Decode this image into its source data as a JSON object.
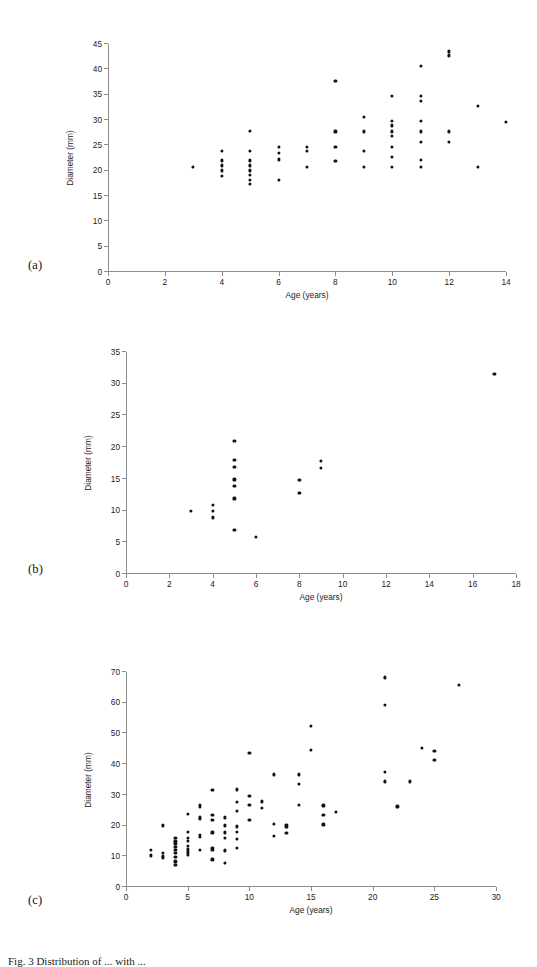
{
  "figure": {
    "caption": "Fig. 3  Distribution of ... with ...",
    "panels": [
      {
        "letter": "(a)"
      },
      {
        "letter": "(b)"
      },
      {
        "letter": "(c)"
      }
    ]
  },
  "chart_data": [
    {
      "type": "scatter",
      "panel": "(a)",
      "title": "",
      "xlabel": "Age (years)",
      "ylabel": "Diameter (mm)",
      "xlim": [
        0,
        14
      ],
      "ylim": [
        0,
        45
      ],
      "xticks": [
        0,
        2,
        4,
        6,
        8,
        10,
        12,
        14
      ],
      "yticks": [
        0,
        5,
        10,
        15,
        20,
        25,
        30,
        35,
        40,
        45
      ],
      "grid": false,
      "legend": null,
      "points": [
        [
          3,
          20.7
        ],
        [
          4,
          23.8
        ],
        [
          4,
          22.0
        ],
        [
          4,
          21.0
        ],
        [
          4,
          20.0
        ],
        [
          4,
          18.9
        ],
        [
          5,
          27.8
        ],
        [
          5,
          23.8
        ],
        [
          5,
          22.0
        ],
        [
          5,
          21.0
        ],
        [
          5,
          20.0
        ],
        [
          5,
          19.2
        ],
        [
          5,
          18.2
        ],
        [
          5,
          17.4
        ],
        [
          6,
          24.7
        ],
        [
          6,
          23.4
        ],
        [
          6,
          22.2
        ],
        [
          6,
          18.2
        ],
        [
          7,
          24.7
        ],
        [
          7,
          23.8
        ],
        [
          7,
          20.7
        ],
        [
          8,
          37.7
        ],
        [
          8,
          27.7
        ],
        [
          8,
          24.7
        ],
        [
          8,
          21.9
        ],
        [
          9,
          30.6
        ],
        [
          9,
          27.7
        ],
        [
          9,
          23.8
        ],
        [
          9,
          20.7
        ],
        [
          10,
          34.8
        ],
        [
          10,
          29.8
        ],
        [
          10,
          28.9
        ],
        [
          10,
          27.7
        ],
        [
          10,
          26.8
        ],
        [
          10,
          24.7
        ],
        [
          10,
          22.7
        ],
        [
          10,
          20.7
        ],
        [
          11,
          40.6
        ],
        [
          11,
          34.8
        ],
        [
          11,
          33.8
        ],
        [
          11,
          29.8
        ],
        [
          11,
          27.7
        ],
        [
          11,
          25.7
        ],
        [
          11,
          22.1
        ],
        [
          11,
          20.7
        ],
        [
          12,
          43.5
        ],
        [
          12,
          42.7
        ],
        [
          12,
          27.7
        ],
        [
          12,
          25.7
        ],
        [
          13,
          32.7
        ],
        [
          13,
          20.7
        ],
        [
          14,
          29.6
        ]
      ]
    },
    {
      "type": "scatter",
      "panel": "(b)",
      "title": "",
      "xlabel": "Age (years)",
      "ylabel": "Diameter (mm)",
      "xlim": [
        0,
        18
      ],
      "ylim": [
        0,
        35
      ],
      "xticks": [
        0,
        2,
        4,
        6,
        8,
        10,
        12,
        14,
        16,
        18
      ],
      "yticks": [
        0,
        5,
        10,
        15,
        20,
        25,
        30,
        35
      ],
      "grid": false,
      "legend": null,
      "points": [
        [
          3,
          9.9
        ],
        [
          4,
          10.9
        ],
        [
          4,
          9.9
        ],
        [
          4,
          8.9
        ],
        [
          5,
          20.9
        ],
        [
          5,
          17.9
        ],
        [
          5,
          16.9
        ],
        [
          5,
          14.9
        ],
        [
          5,
          13.9
        ],
        [
          5,
          11.9
        ],
        [
          5,
          6.9
        ],
        [
          6,
          5.8
        ],
        [
          8,
          14.8
        ],
        [
          8,
          12.8
        ],
        [
          9,
          17.8
        ],
        [
          9,
          16.7
        ],
        [
          17,
          31.5
        ]
      ]
    },
    {
      "type": "scatter",
      "panel": "(c)",
      "title": "",
      "xlabel": "Age (years)",
      "ylabel": "Diameter (mm)",
      "xlim": [
        0,
        30
      ],
      "ylim": [
        0,
        70
      ],
      "xticks": [
        0,
        5,
        10,
        15,
        20,
        25,
        30
      ],
      "yticks": [
        0,
        10,
        20,
        30,
        40,
        50,
        60,
        70
      ],
      "grid": false,
      "legend": null,
      "points": [
        [
          2,
          12.0
        ],
        [
          2,
          10.2
        ],
        [
          3,
          20.0
        ],
        [
          3,
          11.0
        ],
        [
          3,
          10.0
        ],
        [
          3,
          9.6
        ],
        [
          4,
          16.0
        ],
        [
          4,
          14.8
        ],
        [
          4,
          13.9
        ],
        [
          4,
          12.9
        ],
        [
          4,
          12.0
        ],
        [
          4,
          11.0
        ],
        [
          4,
          9.7
        ],
        [
          4,
          8.3
        ],
        [
          4,
          7.2
        ],
        [
          5,
          23.8
        ],
        [
          5,
          18.0
        ],
        [
          5,
          16.0
        ],
        [
          5,
          15.0
        ],
        [
          5,
          13.2
        ],
        [
          5,
          12.2
        ],
        [
          5,
          11.2
        ],
        [
          5,
          10.3
        ],
        [
          6,
          26.6
        ],
        [
          6,
          25.9
        ],
        [
          6,
          22.6
        ],
        [
          6,
          22.0
        ],
        [
          6,
          17.0
        ],
        [
          6,
          16.2
        ],
        [
          6,
          11.9
        ],
        [
          7,
          31.6
        ],
        [
          7,
          23.5
        ],
        [
          7,
          21.7
        ],
        [
          7,
          17.7
        ],
        [
          7,
          12.8
        ],
        [
          7,
          11.9
        ],
        [
          7,
          8.9
        ],
        [
          8,
          22.6
        ],
        [
          8,
          20.0
        ],
        [
          8,
          17.7
        ],
        [
          8,
          16.0
        ],
        [
          8,
          12.0
        ],
        [
          8,
          11.6
        ],
        [
          8,
          7.9
        ],
        [
          9,
          31.7
        ],
        [
          9,
          27.6
        ],
        [
          9,
          24.7
        ],
        [
          9,
          19.7
        ],
        [
          9,
          18.0
        ],
        [
          9,
          15.7
        ],
        [
          9,
          12.7
        ],
        [
          10,
          43.6
        ],
        [
          10,
          29.7
        ],
        [
          10,
          26.6
        ],
        [
          10,
          21.7
        ],
        [
          11,
          27.8
        ],
        [
          11,
          25.7
        ],
        [
          12,
          36.6
        ],
        [
          12,
          20.5
        ],
        [
          12,
          16.7
        ],
        [
          13,
          20.1
        ],
        [
          13,
          19.6
        ],
        [
          13,
          17.6
        ],
        [
          14,
          36.6
        ],
        [
          14,
          33.5
        ],
        [
          14,
          26.6
        ],
        [
          15,
          52.4
        ],
        [
          15,
          44.5
        ],
        [
          16,
          26.5
        ],
        [
          16,
          23.5
        ],
        [
          16,
          20.3
        ],
        [
          17,
          24.3
        ],
        [
          21,
          68.2
        ],
        [
          21,
          59.2
        ],
        [
          21,
          37.3
        ],
        [
          21,
          34.3
        ],
        [
          22,
          26.2
        ],
        [
          23,
          34.3
        ],
        [
          24,
          45.3
        ],
        [
          25,
          44.2
        ],
        [
          25,
          41.2
        ],
        [
          27,
          65.8
        ]
      ]
    }
  ]
}
